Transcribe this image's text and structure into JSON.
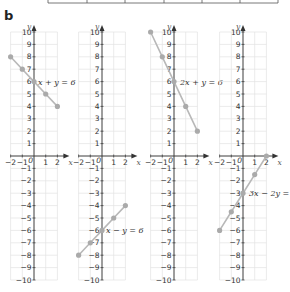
{
  "part_label": "b",
  "chart_data": [
    {
      "type": "line",
      "title": "x + y = 6",
      "xlabel": "x",
      "ylabel": "y",
      "xlim": [
        -2,
        2
      ],
      "ylim": [
        -10,
        10
      ],
      "x_ticks": [
        -2,
        -1,
        0,
        1,
        2
      ],
      "y_ticks": [
        10,
        9,
        8,
        7,
        6,
        5,
        4,
        3,
        2,
        1,
        -1,
        -2,
        -3,
        -4,
        -5,
        -6,
        -7,
        -8,
        -9,
        -10
      ],
      "grid": true,
      "x": [
        -2,
        -1,
        0,
        1,
        2
      ],
      "values": [
        8,
        7,
        6,
        5,
        4
      ]
    },
    {
      "type": "line",
      "title": "x − y = 6",
      "xlabel": "x",
      "ylabel": "y",
      "xlim": [
        -2,
        2
      ],
      "ylim": [
        -10,
        10
      ],
      "x_ticks": [
        -2,
        -1,
        0,
        1,
        2
      ],
      "y_ticks": [
        10,
        9,
        8,
        7,
        6,
        5,
        4,
        3,
        2,
        1,
        -1,
        -2,
        -3,
        -4,
        -5,
        -6,
        -7,
        -8,
        -9,
        -10
      ],
      "grid": true,
      "x": [
        -2,
        -1,
        0,
        1,
        2
      ],
      "values": [
        -8,
        -7,
        -6,
        -5,
        -4
      ]
    },
    {
      "type": "line",
      "title": "2x + y = 6",
      "xlabel": "x",
      "ylabel": "y",
      "xlim": [
        -2,
        2
      ],
      "ylim": [
        -10,
        10
      ],
      "x_ticks": [
        -2,
        -1,
        0,
        1,
        2
      ],
      "y_ticks": [
        10,
        9,
        8,
        7,
        6,
        5,
        4,
        3,
        2,
        1,
        -1,
        -2,
        -3,
        -4,
        -5,
        -6,
        -7,
        -8,
        -9,
        -10
      ],
      "grid": true,
      "x": [
        -2,
        -1,
        0,
        1,
        2
      ],
      "values": [
        10,
        8,
        6,
        4,
        2
      ]
    },
    {
      "type": "line",
      "title": "3x − 2y = 6",
      "xlabel": "x",
      "ylabel": "y",
      "xlim": [
        -2,
        2
      ],
      "ylim": [
        -10,
        10
      ],
      "x_ticks": [
        -2,
        -1,
        0,
        1,
        2
      ],
      "y_ticks": [
        10,
        9,
        8,
        7,
        6,
        5,
        4,
        3,
        2,
        1,
        -1,
        -2,
        -3,
        -4,
        -5,
        -6,
        -7,
        -8,
        -9,
        -10
      ],
      "grid": true,
      "x": [
        -2,
        -1,
        0,
        1,
        2
      ],
      "values": [
        -6,
        -4.5,
        -3,
        -1.5,
        0
      ]
    }
  ],
  "style": {
    "line_color": "#b8b8b8",
    "marker_color": "#aaaaaa",
    "grid_color": "#e2e2e2",
    "axis_color": "#333333"
  }
}
